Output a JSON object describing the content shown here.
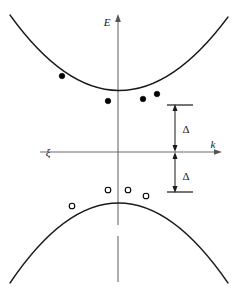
{
  "figure": {
    "background_color": "#ffffff",
    "curve_color": "#1a1a1a",
    "axis_color": "#6b6b6b",
    "marker_color": "#000000",
    "width": 240,
    "height": 300
  },
  "axes": {
    "vertical": {
      "label": "E",
      "name": "energy-axis",
      "x": 118,
      "top": 18,
      "bottom": 282,
      "arrow": "up",
      "gap_start": 225,
      "gap_end": 236,
      "label_x": 107,
      "label_y": 26
    },
    "horizontal": {
      "label": "k",
      "name": "wavevector-axis",
      "y": 152,
      "left": 40,
      "right": 222,
      "arrow": "right",
      "label_x": 213,
      "label_y": 148
    },
    "fermi": {
      "label": "ξ",
      "name": "fermi-level-label",
      "x": 48,
      "y": 156
    }
  },
  "annotations": {
    "gap_upper": {
      "label": "Δ",
      "label_x": 186,
      "label_y": 133,
      "bar_y": 105,
      "arrow_x": 175,
      "arrow_top": 105,
      "arrow_bottom": 152,
      "bar_x1": 167,
      "bar_x2": 193
    },
    "gap_lower": {
      "label": "Δ",
      "label_x": 186,
      "label_y": 180,
      "bar_y": 192,
      "arrow_x": 175,
      "arrow_top": 152,
      "arrow_bottom": 192,
      "bar_x1": 167,
      "bar_x2": 193
    }
  },
  "chart_data": {
    "type": "line",
    "xlabel": "k",
    "ylabel": "E",
    "grid": false,
    "legend": "none",
    "xlim": [
      -108,
      104
    ],
    "ylim": [
      -130,
      134
    ],
    "origin_px": [
      118,
      152
    ],
    "series": [
      {
        "name": "conduction-band",
        "type": "parabola",
        "curvature": "upward",
        "vertex_px": [
          118,
          101
        ],
        "path": "M 10,15 Q 118,165 228,17",
        "markers": {
          "style": "filled-circle",
          "meaning": "electron",
          "radius": 2.8,
          "points_px": [
            [
              62,
              76
            ],
            [
              108,
              101
            ],
            [
              143,
              99
            ],
            [
              157,
              94
            ]
          ]
        }
      },
      {
        "name": "valence-band",
        "type": "parabola",
        "curvature": "downward",
        "vertex_px": [
          118,
          188
        ],
        "path": "M 10,283 Q 118,123 228,283",
        "markers": {
          "style": "open-circle",
          "meaning": "hole",
          "radius": 2.8,
          "points_px": [
            [
              72,
              206
            ],
            [
              108,
              190
            ],
            [
              128,
              190
            ],
            [
              146,
              196
            ]
          ]
        }
      }
    ],
    "annotations": [
      {
        "name": "gap-upper",
        "label": "Δ",
        "from_px": [
          175,
          105
        ],
        "to_px": [
          175,
          152
        ],
        "meaning": "energy gap above Fermi level"
      },
      {
        "name": "gap-lower",
        "label": "Δ",
        "from_px": [
          175,
          152
        ],
        "to_px": [
          175,
          192
        ],
        "meaning": "energy gap below Fermi level"
      },
      {
        "name": "fermi-level",
        "label": "ξ",
        "at_px": [
          48,
          156
        ],
        "meaning": "chemical potential / Fermi level line"
      }
    ]
  }
}
